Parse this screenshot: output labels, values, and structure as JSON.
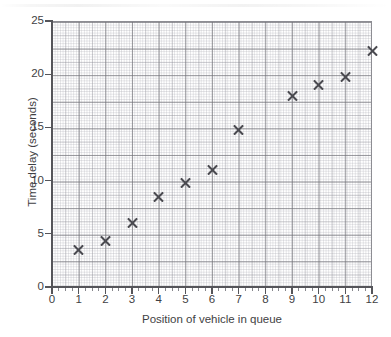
{
  "chart_data": {
    "type": "scatter",
    "title": "",
    "xlabel": "Position of vehicle in queue",
    "ylabel": "Time delay (seconds)",
    "xlim": [
      0,
      12
    ],
    "ylim": [
      0,
      25
    ],
    "xticks": [
      "0",
      "1",
      "2",
      "3",
      "4",
      "5",
      "6",
      "7",
      "8",
      "9",
      "10",
      "11",
      "12"
    ],
    "yticks": [
      "0",
      "5",
      "10",
      "15",
      "20",
      "25"
    ],
    "x_major_step": 1,
    "x_minor_step": 0.25,
    "y_major_step": 2.5,
    "y_tick_label_step": 5,
    "y_minor_step": 0.25,
    "grid": true,
    "legend": null,
    "marker_style": "x",
    "marker_color": "#4a4a50",
    "grid_color": "#8e8e96",
    "axis_color": "#55555a",
    "background_color": "#ffffff",
    "x": [
      1,
      2,
      3,
      4,
      5,
      6,
      7,
      9,
      10,
      11,
      12
    ],
    "y": [
      3.5,
      4.3,
      6.0,
      8.5,
      9.8,
      11.0,
      14.8,
      18.0,
      19.0,
      19.7,
      22.2
    ],
    "points": [
      {
        "x": 1,
        "y": 3.5
      },
      {
        "x": 2,
        "y": 4.3
      },
      {
        "x": 3,
        "y": 6.0
      },
      {
        "x": 4,
        "y": 8.5
      },
      {
        "x": 5,
        "y": 9.8
      },
      {
        "x": 6,
        "y": 11.0
      },
      {
        "x": 7,
        "y": 14.8
      },
      {
        "x": 9,
        "y": 18.0
      },
      {
        "x": 10,
        "y": 19.0
      },
      {
        "x": 11,
        "y": 19.7
      },
      {
        "x": 12,
        "y": 22.2
      }
    ],
    "note_missing_x": [
      8
    ]
  }
}
